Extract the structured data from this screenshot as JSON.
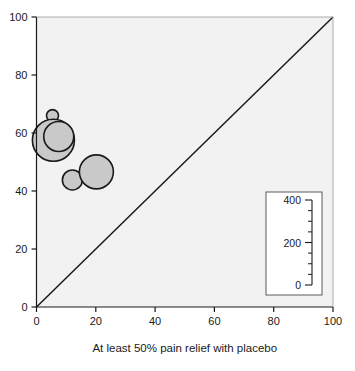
{
  "chart_data": {
    "type": "scatter",
    "variant": "bubble",
    "title": "",
    "xlabel": "At least 50% pain relief with placebo",
    "ylabel": "",
    "xlim": [
      0,
      100
    ],
    "ylim": [
      0,
      100
    ],
    "xticks": [
      0,
      20,
      40,
      60,
      80,
      100
    ],
    "yticks": [
      0,
      20,
      40,
      60,
      80,
      100
    ],
    "xticklabels": [
      "0",
      "20",
      "40",
      "60",
      "80",
      "100"
    ],
    "yticklabels": [
      "0",
      "20",
      "40",
      "60",
      "80",
      "100"
    ],
    "grid": false,
    "legend_position": "bottom-right",
    "plot_background": "#f2f2f2",
    "bubble_fill": "#c9c9c9",
    "bubble_stroke": "#1a1a1a",
    "reference_line": {
      "name": "line-of-equality",
      "from": [
        0,
        0
      ],
      "to": [
        100,
        100
      ],
      "color": "#1a1a1a"
    },
    "size_legend": {
      "name": "bubble-size-scale",
      "ticks": [
        0,
        200,
        400
      ],
      "tick_labels": [
        "0",
        "200",
        "400"
      ],
      "minor_ticks": [
        50,
        100,
        150,
        250,
        300,
        350
      ],
      "unit": ""
    },
    "points": [
      {
        "name": "bubble-1",
        "x": 5.4,
        "y": 66.0,
        "r_px": 6.0,
        "size": 40
      },
      {
        "name": "bubble-2",
        "x": 5.7,
        "y": 57.5,
        "r_px": 21.0,
        "size": 430
      },
      {
        "name": "bubble-3",
        "x": 7.5,
        "y": 58.8,
        "r_px": 15.0,
        "size": 225
      },
      {
        "name": "bubble-4",
        "x": 12.1,
        "y": 43.8,
        "r_px": 10.0,
        "size": 100
      },
      {
        "name": "bubble-5",
        "x": 20.2,
        "y": 46.6,
        "r_px": 17.0,
        "size": 285
      }
    ]
  },
  "top_clipped_text": ""
}
